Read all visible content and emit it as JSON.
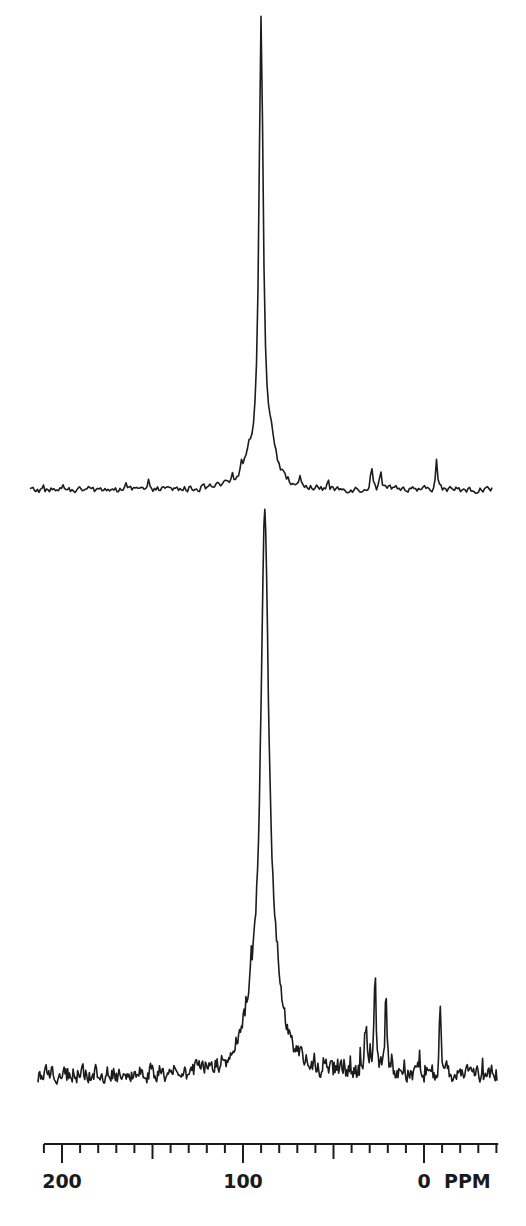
{
  "figure": {
    "background": "#ffffff",
    "ink_color": "#1c1c1c"
  },
  "chart_data": [
    {
      "type": "line",
      "title": "",
      "panel": "upper spectrum",
      "xlabel": "PPM",
      "ylabel": "",
      "x_unit": "ppm",
      "xlim": [
        210,
        -38
      ],
      "x_reversed": true,
      "grid": false,
      "legend": "none",
      "baseline_y_px": 490,
      "x_px_range": [
        30,
        492
      ],
      "noise_amplitude_px": 6,
      "peaks": [
        {
          "position_ppm": 90,
          "height_px": 452,
          "half_width_ppm": 1.4,
          "label": "main resonance"
        },
        {
          "position_ppm": 85,
          "height_px": 40,
          "half_width_ppm": 4,
          "label": "shoulder"
        },
        {
          "position_ppm": 97,
          "height_px": 22,
          "half_width_ppm": 5,
          "label": "shoulder"
        },
        {
          "position_ppm": 29,
          "height_px": 26,
          "half_width_ppm": 0.6,
          "label": "spike"
        },
        {
          "position_ppm": 24,
          "height_px": 18,
          "half_width_ppm": 0.6,
          "label": "spike"
        },
        {
          "position_ppm": -7,
          "height_px": 30,
          "half_width_ppm": 0.6,
          "label": "spike"
        }
      ]
    },
    {
      "type": "line",
      "title": "",
      "panel": "lower spectrum",
      "xlabel": "PPM",
      "ylabel": "",
      "x_unit": "ppm",
      "xlim": [
        214,
        -40
      ],
      "x_reversed": true,
      "grid": false,
      "legend": "none",
      "baseline_y_px": 1075,
      "x_px_range": [
        38,
        497
      ],
      "noise_amplitude_px": 16,
      "peaks": [
        {
          "position_ppm": 88,
          "height_px": 528,
          "half_width_ppm": 2.6,
          "label": "main resonance"
        },
        {
          "position_ppm": 82,
          "height_px": 60,
          "half_width_ppm": 5,
          "label": "shoulder"
        },
        {
          "position_ppm": 95,
          "height_px": 45,
          "half_width_ppm": 6,
          "label": "shoulder"
        },
        {
          "position_ppm": 27,
          "height_px": 105,
          "half_width_ppm": 0.6,
          "label": "spike"
        },
        {
          "position_ppm": 21,
          "height_px": 82,
          "half_width_ppm": 0.6,
          "label": "spike"
        },
        {
          "position_ppm": 32,
          "height_px": 45,
          "half_width_ppm": 0.6,
          "label": "spike"
        },
        {
          "position_ppm": -9,
          "height_px": 58,
          "half_width_ppm": 0.6,
          "label": "spike"
        }
      ]
    }
  ],
  "axis": {
    "unit_label": "PPM",
    "axis_y_px": 1144,
    "ppm_to_px": {
      "zero_px": 424,
      "px_per_ppm": 1.81
    },
    "range_ppm": [
      210,
      -41
    ],
    "major_ticks": [
      200,
      100,
      0
    ],
    "major_tick_labels": [
      "200",
      "100",
      "0"
    ],
    "mid_ticks": [
      150,
      50
    ],
    "minor_tick_step": 10,
    "minor_ticks": [
      210,
      190,
      180,
      170,
      160,
      140,
      130,
      120,
      110,
      90,
      80,
      70,
      60,
      40,
      30,
      20,
      10,
      -10,
      -20,
      -30,
      -40
    ]
  }
}
